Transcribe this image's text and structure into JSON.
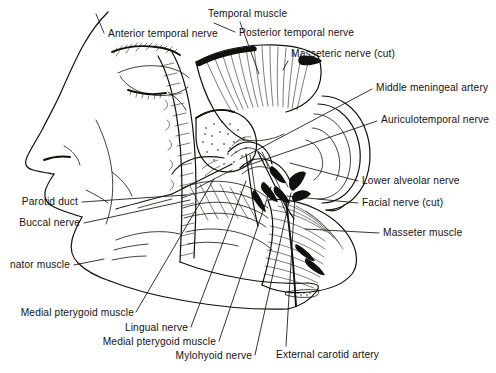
{
  "figure": {
    "background_color": "#ffffff",
    "ink_color": "#12100e",
    "style": "black-and-white pen-and-ink anatomical line drawing"
  },
  "labels": [
    {
      "id": "anterior-temporal-nerve",
      "text": "Anterior temporal nerve",
      "anchor": "start",
      "x": 108,
      "y": 37,
      "leader": "M 104 33 L 96 14"
    },
    {
      "id": "temporal-muscle",
      "text": "Temporal muscle",
      "anchor": "start",
      "x": 208,
      "y": 17,
      "leader": "M 240 22 L 259 74"
    },
    {
      "id": "posterior-temporal-nerve",
      "text": "Posterior temporal nerve",
      "anchor": "start",
      "x": 239,
      "y": 36,
      "leader": "M 235 32 L 214 23"
    },
    {
      "id": "masseteric-nerve-cut",
      "text": "Masseteric nerve (cut)",
      "anchor": "start",
      "x": 291,
      "y": 57,
      "leader": "M 288 61 L 283 70"
    },
    {
      "id": "middle-meningeal-artery",
      "text": "Middle meningeal artery",
      "anchor": "start",
      "x": 376,
      "y": 91,
      "leader": "M 372 89 L 240 159"
    },
    {
      "id": "auriculotemporal-nerve",
      "text": "Auriculotemporal nerve",
      "anchor": "start",
      "x": 381,
      "y": 123,
      "leader": "M 377 121 L 243 167"
    },
    {
      "id": "lower-alveolar-nerve",
      "text": "Lower alveolar nerve",
      "anchor": "start",
      "x": 362,
      "y": 184,
      "leader": "M 358 181 L 290 163"
    },
    {
      "id": "facial-nerve-cut",
      "text": "Facial nerve (cut)",
      "anchor": "start",
      "x": 362,
      "y": 206,
      "leader": "M 358 203 L 287 196"
    },
    {
      "id": "masseter-muscle",
      "text": "Masseter muscle",
      "anchor": "start",
      "x": 383,
      "y": 236,
      "leader": "M 379 233 L 305 229"
    },
    {
      "id": "parotid-duct",
      "text": "Parotid duct",
      "anchor": "end",
      "x": 78,
      "y": 205,
      "leader": "M 82 202 L 186 195"
    },
    {
      "id": "buccal-nerve",
      "text": "Buccal nerve",
      "anchor": "end",
      "x": 80,
      "y": 226,
      "leader": "M 84 223 L 190 200"
    },
    {
      "id": "buccinator-muscle",
      "text": "nator muscle",
      "anchor": "end",
      "x": 70,
      "y": 268,
      "leader": "M 74 265 L 104 259",
      "note": "clipped at left image edge"
    },
    {
      "id": "medial-pterygoid-muscle-upper",
      "text": "Medial pterygoid muscle",
      "anchor": "end",
      "x": 134,
      "y": 316,
      "leader": "M 136 312 L 214 179"
    },
    {
      "id": "lingual-nerve",
      "text": "Lingual nerve",
      "anchor": "end",
      "x": 188,
      "y": 331,
      "leader": "M 191 327 L 246 181"
    },
    {
      "id": "medial-pterygoid-muscle-lower",
      "text": "Medial pterygoid muscle",
      "anchor": "end",
      "x": 216,
      "y": 345,
      "leader": "M 219 341 L 271 187"
    },
    {
      "id": "mylohyoid-nerve",
      "text": "Mylohyoid nerve",
      "anchor": "end",
      "x": 252,
      "y": 359,
      "leader": "M 255 355 L 291 193"
    },
    {
      "id": "external-carotid-artery",
      "text": "External carotid artery",
      "anchor": "start",
      "x": 276,
      "y": 358,
      "leader": "M 286 346 L 295 196"
    }
  ]
}
